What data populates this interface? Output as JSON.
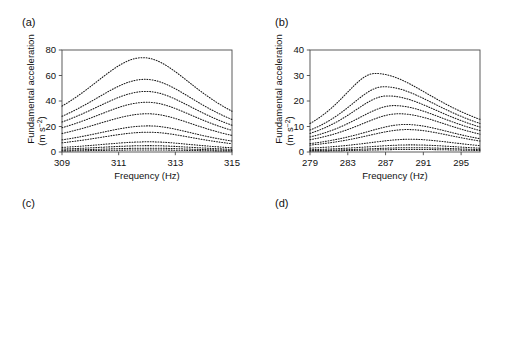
{
  "figure": {
    "panels": [
      {
        "id": "a",
        "label": "(a)"
      },
      {
        "id": "b",
        "label": "(b)"
      },
      {
        "id": "c",
        "label": "(c)"
      },
      {
        "id": "d",
        "label": "(d)"
      }
    ]
  },
  "axis_text": {
    "freq_xlabel": "Frequency (Hz)",
    "fund_ylabel_line1": "Fundamental acceleration",
    "fund_ylabel_line2_pre": "(m s",
    "fund_ylabel_line2_sup": "−2",
    "fund_ylabel_line2_post": ")",
    "res_ylabel_line1": "Resonance frequency",
    "res_ylabel_line2_pre": "shift (Hz Hz",
    "res_ylabel_line2_sup": "−1",
    "res_ylabel_line2_post": ")",
    "amp_xlabel_pre": "Fundamental acceleration amplitude (m s",
    "amp_xlabel_sup": "−2",
    "amp_xlabel_post": ")"
  },
  "chart_data": [
    {
      "panel": "a",
      "type": "line",
      "title": "",
      "xlabel": "Frequency (Hz)",
      "ylabel": "Fundamental acceleration (m s-2)",
      "xlim": [
        309,
        315
      ],
      "ylim": [
        0,
        80
      ],
      "xticks": [
        309,
        311,
        313,
        315
      ],
      "yticks": [
        0,
        20,
        40,
        60,
        80
      ],
      "xscale": "linear",
      "yscale": "linear",
      "grid": false,
      "line_style": "dotted",
      "series": [
        {
          "name": "drive-10",
          "peak_x": 311.85,
          "peak_y": 74.0,
          "left_y": 36.0,
          "right_y": 32.0,
          "width": 1.55
        },
        {
          "name": "drive-9",
          "peak_x": 311.93,
          "peak_y": 57.0,
          "left_y": 28.0,
          "right_y": 25.5,
          "width": 1.6
        },
        {
          "name": "drive-8",
          "peak_x": 311.97,
          "peak_y": 47.5,
          "left_y": 23.5,
          "right_y": 21.0,
          "width": 1.62
        },
        {
          "name": "drive-7",
          "peak_x": 312.0,
          "peak_y": 39.0,
          "left_y": 19.0,
          "right_y": 17.0,
          "width": 1.64
        },
        {
          "name": "drive-6",
          "peak_x": 312.02,
          "peak_y": 30.0,
          "left_y": 14.5,
          "right_y": 13.0,
          "width": 1.66
        },
        {
          "name": "drive-5",
          "peak_x": 312.04,
          "peak_y": 20.5,
          "left_y": 9.5,
          "right_y": 8.6,
          "width": 1.68
        },
        {
          "name": "drive-4",
          "peak_x": 312.05,
          "peak_y": 15.5,
          "left_y": 7.2,
          "right_y": 6.5,
          "width": 1.7
        },
        {
          "name": "drive-3",
          "peak_x": 312.06,
          "peak_y": 8.0,
          "left_y": 3.6,
          "right_y": 3.3,
          "width": 1.72
        },
        {
          "name": "drive-2",
          "peak_x": 312.06,
          "peak_y": 5.0,
          "left_y": 2.3,
          "right_y": 2.1,
          "width": 1.74
        },
        {
          "name": "drive-1",
          "peak_x": 312.06,
          "peak_y": 3.0,
          "left_y": 1.4,
          "right_y": 1.3,
          "width": 1.76
        },
        {
          "name": "drive-0",
          "peak_x": 312.06,
          "peak_y": 1.6,
          "left_y": 0.8,
          "right_y": 0.7,
          "width": 1.78
        }
      ]
    },
    {
      "panel": "b",
      "type": "line",
      "title": "",
      "xlabel": "Frequency (Hz)",
      "ylabel": "Fundamental acceleration (m s-2)",
      "xlim": [
        279,
        297
      ],
      "ylim": [
        0,
        40
      ],
      "xticks": [
        279,
        283,
        287,
        291,
        295
      ],
      "yticks": [
        0,
        10,
        20,
        30,
        40
      ],
      "xscale": "linear",
      "yscale": "linear",
      "grid": false,
      "line_style": "dotted",
      "series": [
        {
          "name": "drive-10",
          "peak_x": 285.9,
          "peak_y": 30.8,
          "left_y": 11.2,
          "right_y": 12.8,
          "width": 3.4
        },
        {
          "name": "drive-9",
          "peak_x": 286.8,
          "peak_y": 25.6,
          "left_y": 8.6,
          "right_y": 11.2,
          "width": 3.4
        },
        {
          "name": "drive-8",
          "peak_x": 287.2,
          "peak_y": 22.0,
          "left_y": 7.3,
          "right_y": 9.8,
          "width": 3.4
        },
        {
          "name": "drive-7",
          "peak_x": 287.9,
          "peak_y": 18.2,
          "left_y": 5.9,
          "right_y": 8.4,
          "width": 3.4
        },
        {
          "name": "drive-6",
          "peak_x": 288.4,
          "peak_y": 15.0,
          "left_y": 4.8,
          "right_y": 7.0,
          "width": 3.4
        },
        {
          "name": "drive-5",
          "peak_x": 289.1,
          "peak_y": 10.8,
          "left_y": 3.3,
          "right_y": 5.2,
          "width": 3.4
        },
        {
          "name": "drive-4",
          "peak_x": 289.3,
          "peak_y": 8.8,
          "left_y": 2.7,
          "right_y": 4.3,
          "width": 3.4
        },
        {
          "name": "drive-3",
          "peak_x": 289.6,
          "peak_y": 5.0,
          "left_y": 1.5,
          "right_y": 2.5,
          "width": 3.4
        },
        {
          "name": "drive-2",
          "peak_x": 289.7,
          "peak_y": 2.8,
          "left_y": 0.9,
          "right_y": 1.5,
          "width": 3.4
        },
        {
          "name": "drive-1",
          "peak_x": 289.8,
          "peak_y": 1.7,
          "left_y": 0.55,
          "right_y": 0.95,
          "width": 3.4
        },
        {
          "name": "drive-0",
          "peak_x": 289.8,
          "peak_y": 1.0,
          "left_y": 0.35,
          "right_y": 0.6,
          "width": 3.4
        }
      ]
    },
    {
      "panel": "c",
      "type": "scatter",
      "title": "",
      "xlabel": "Fundamental acceleration amplitude (m s-2)",
      "ylabel": "Resonance frequency shift (Hz Hz-1)",
      "xlim": [
        1,
        100
      ],
      "ylim": [
        0.0001,
        0.1
      ],
      "xticks": [
        1,
        10,
        100
      ],
      "yticks": [
        0.0001,
        0.001,
        0.01,
        0.1
      ],
      "xscale": "log",
      "yscale": "log",
      "grid": true,
      "marker": "diamond",
      "points": [
        {
          "x": 8.2,
          "y": 0.000105
        },
        {
          "x": 16.0,
          "y": 0.000215
        },
        {
          "x": 20.0,
          "y": 0.000255
        },
        {
          "x": 29.0,
          "y": 0.000375
        },
        {
          "x": 37.0,
          "y": 0.0005
        },
        {
          "x": 44.0,
          "y": 0.00058
        },
        {
          "x": 50.0,
          "y": 0.00064
        },
        {
          "x": 56.0,
          "y": 0.00069
        },
        {
          "x": 62.0,
          "y": 0.00076
        },
        {
          "x": 73.0,
          "y": 0.0009
        }
      ]
    },
    {
      "panel": "d",
      "type": "scatter",
      "title": "",
      "xlabel": "Fundamental acceleration amplitude (m s-2)",
      "ylabel": "Resonance frequency shift (Hz Hz-1)",
      "xlim": [
        1,
        100
      ],
      "ylim": [
        0.0001,
        0.1
      ],
      "xticks": [
        1,
        10,
        100
      ],
      "yticks": [
        0.0001,
        0.001,
        0.01,
        0.1
      ],
      "xscale": "log",
      "yscale": "log",
      "grid": true,
      "marker": "diamond",
      "points": [
        {
          "x": 1.32,
          "y": 0.00078
        },
        {
          "x": 2.65,
          "y": 0.00185
        },
        {
          "x": 5.0,
          "y": 0.0029
        },
        {
          "x": 9.1,
          "y": 0.0049
        },
        {
          "x": 11.4,
          "y": 0.0061
        },
        {
          "x": 14.9,
          "y": 0.0079
        },
        {
          "x": 18.0,
          "y": 0.0093
        },
        {
          "x": 20.3,
          "y": 0.0102
        },
        {
          "x": 22.5,
          "y": 0.0112
        },
        {
          "x": 25.0,
          "y": 0.013
        },
        {
          "x": 30.0,
          "y": 0.0158
        }
      ]
    }
  ]
}
